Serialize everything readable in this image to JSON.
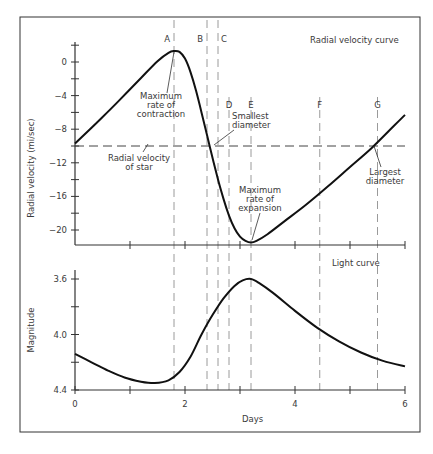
{
  "chart_data": [
    {
      "id": "radial-velocity",
      "type": "line",
      "title": "Radial velocity curve",
      "xlabel": "",
      "ylabel": "Radial velocity (mi/sec)",
      "xlim": [
        0,
        6
      ],
      "ylim": [
        -22,
        2.5
      ],
      "y_ticks": [
        0,
        -4,
        -8,
        -12,
        -16,
        -20
      ],
      "y_tick_labels": [
        "0",
        "-4",
        "-8",
        "-12",
        "-16",
        "-20"
      ],
      "y_minor_ticks": [
        2,
        -2,
        -6,
        -10,
        -14,
        -18
      ],
      "x_ticks": [
        1,
        2,
        3,
        4,
        5,
        6
      ],
      "grid": false,
      "series": [
        {
          "name": "Radial velocity",
          "x": [
            0,
            0.4,
            0.8,
            1.2,
            1.5,
            1.7,
            1.8,
            1.9,
            2.0,
            2.1,
            2.2,
            2.3,
            2.4,
            2.5,
            2.6,
            2.7,
            2.8,
            2.9,
            3.0,
            3.1,
            3.2,
            3.3,
            3.5,
            3.8,
            4.2,
            4.6,
            5.0,
            5.4,
            5.8,
            6.0
          ],
          "y": [
            -9.7,
            -7.2,
            -4.6,
            -1.9,
            0.1,
            1.1,
            1.3,
            1.2,
            0.4,
            -1.2,
            -3.4,
            -6.0,
            -8.7,
            -11.4,
            -14.0,
            -16.3,
            -18.3,
            -19.8,
            -20.8,
            -21.3,
            -21.5,
            -21.3,
            -20.5,
            -19.0,
            -17.0,
            -14.8,
            -12.5,
            -10.2,
            -7.6,
            -6.3
          ]
        }
      ],
      "reference_line": {
        "label": "Radial velocity of star",
        "y": -10
      },
      "annotations": [
        {
          "text": [
            "Maximum",
            "rate of",
            "contraction"
          ],
          "at_x": 1.8,
          "at_y": 1.3
        },
        {
          "text": [
            "Smallest",
            "diameter"
          ],
          "at_x": 2.55,
          "at_y": -10
        },
        {
          "text": [
            "Radial velocity",
            "of star"
          ],
          "at_x": 1.25,
          "at_y": -10
        },
        {
          "text": [
            "Maximum",
            "rate of",
            "expansion"
          ],
          "at_x": 3.2,
          "at_y": -21.5
        },
        {
          "text": [
            "Largest",
            "diameter"
          ],
          "at_x": 5.5,
          "at_y": -10
        }
      ]
    },
    {
      "id": "light-curve",
      "type": "line",
      "title": "Light curve",
      "xlabel": "Days",
      "ylabel": "Magnitude",
      "xlim": [
        0,
        6
      ],
      "ylim": [
        4.4,
        3.55
      ],
      "y_inverted": true,
      "y_ticks": [
        3.6,
        4.0,
        4.4
      ],
      "y_tick_labels": [
        "3.6",
        "4.0",
        "4.4"
      ],
      "y_minor_ticks": [
        3.8,
        4.2
      ],
      "x_ticks": [
        0,
        1,
        2,
        3,
        4,
        5,
        6
      ],
      "x_tick_labels": [
        "0",
        "",
        "2",
        "",
        "4",
        "",
        "6"
      ],
      "grid": false,
      "series": [
        {
          "name": "Magnitude",
          "x": [
            0,
            0.3,
            0.6,
            0.9,
            1.2,
            1.45,
            1.7,
            1.9,
            2.1,
            2.3,
            2.5,
            2.7,
            2.9,
            3.05,
            3.2,
            3.35,
            3.6,
            4.0,
            4.4,
            4.8,
            5.2,
            5.6,
            6.0
          ],
          "y": [
            4.14,
            4.2,
            4.26,
            4.31,
            4.34,
            4.35,
            4.33,
            4.27,
            4.16,
            4.0,
            3.86,
            3.74,
            3.65,
            3.61,
            3.6,
            3.63,
            3.7,
            3.83,
            3.95,
            4.05,
            4.13,
            4.19,
            4.23
          ]
        }
      ]
    }
  ],
  "phase_markers": [
    {
      "label": "A",
      "x": 1.8
    },
    {
      "label": "B",
      "x": 2.4
    },
    {
      "label": "C",
      "x": 2.6
    },
    {
      "label": "D",
      "x": 2.8
    },
    {
      "label": "E",
      "x": 3.2
    },
    {
      "label": "F",
      "x": 4.45
    },
    {
      "label": "G",
      "x": 5.5
    }
  ],
  "labels": {
    "rv_title": "Radial velocity curve",
    "rv_ylabel": "Radial velocity (mi/sec)",
    "lc_title": "Light curve",
    "lc_ylabel": "Magnitude",
    "xlabel": "Days",
    "ann_contraction": [
      "Maximum",
      "rate of",
      "contraction"
    ],
    "ann_star": [
      "Radial velocity",
      "of star"
    ],
    "ann_smallest": [
      "Smallest",
      "diameter"
    ],
    "ann_expansion": [
      "Maximum",
      "rate of",
      "expansion"
    ],
    "ann_largest": [
      "Largest",
      "diameter"
    ]
  }
}
